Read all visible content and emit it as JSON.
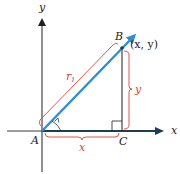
{
  "diagram": {
    "type": "coordinate-vector-diagram",
    "axes": {
      "x_label": "x",
      "y_label": "y"
    },
    "points": {
      "A": "A",
      "B": "B",
      "C": "C",
      "B_coords": "(x, y)"
    },
    "brackets": {
      "r": "r",
      "x": "x",
      "y": "y"
    },
    "colors": {
      "vector": "#2e8fd0",
      "bracket": "#d9453a",
      "axis": "#1f1f1f",
      "x_axis_dark": "#1d3d55"
    }
  }
}
